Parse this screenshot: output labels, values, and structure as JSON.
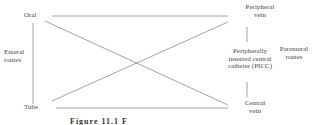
{
  "diagram": {
    "nodes": {
      "oral": "Oral",
      "tube": "Tube",
      "peripheral_vein_line1": "Peripheral",
      "peripheral_vein_line2": "vein",
      "picc_line1": "Peripherally",
      "picc_line2": "inserted central",
      "picc_line3": "catheter (PICC)",
      "central_vein_line1": "Central",
      "central_vein_line2": "vein"
    },
    "groups": {
      "enteral_line1": "Enteral",
      "enteral_line2": "routes",
      "parenteral_line1": "Parenteral",
      "parenteral_line2": "routes"
    },
    "edges": [
      {
        "from": "Oral",
        "to": "Peripheral vein"
      },
      {
        "from": "Oral",
        "to": "Central vein"
      },
      {
        "from": "Tube",
        "to": "Peripheral vein"
      },
      {
        "from": "Tube",
        "to": "Central vein"
      },
      {
        "from": "Oral",
        "to": "Tube"
      },
      {
        "from": "Peripheral vein",
        "to": "PICC"
      },
      {
        "from": "PICC",
        "to": "Central vein"
      }
    ],
    "line_color": "#8a8a8a",
    "caption": "Figure 11.1   F"
  }
}
